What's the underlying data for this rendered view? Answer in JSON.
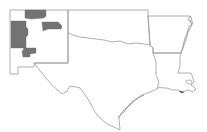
{
  "map": {
    "type": "choropleth-outline",
    "region": "South Central United States",
    "states": [
      "New Mexico",
      "Texas",
      "Oklahoma",
      "Arkansas",
      "Louisiana"
    ],
    "highlighted_regions": [
      {
        "state": "New Mexico",
        "area": "northwest-central block",
        "color": "#737373"
      },
      {
        "state": "New Mexico",
        "area": "north-central block",
        "color": "#737373"
      },
      {
        "state": "New Mexico",
        "area": "northeast-central block",
        "color": "#737373"
      },
      {
        "state": "New Mexico",
        "area": "south-central block",
        "color": "#737373"
      }
    ],
    "colors": {
      "background": "#ffffff",
      "border": "#9a9a9a",
      "highlight": "#737373"
    }
  }
}
